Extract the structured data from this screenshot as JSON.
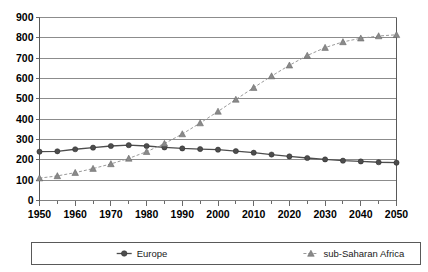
{
  "chart_data": {
    "type": "line",
    "title": "",
    "xlabel": "",
    "ylabel": "",
    "xlim": [
      1950,
      2050
    ],
    "ylim": [
      0,
      900
    ],
    "ytick_step": 100,
    "xtick_step": 10,
    "minor_xtick_step": 5,
    "grid": "horizontal",
    "legend_position": "bottom",
    "yticks": [
      "0",
      "100",
      "200",
      "300",
      "400",
      "500",
      "600",
      "700",
      "800",
      "900"
    ],
    "xticks": [
      "1950",
      "1960",
      "1970",
      "1980",
      "1990",
      "2000",
      "2010",
      "2020",
      "2030",
      "2040",
      "2050"
    ],
    "x": [
      1950,
      1955,
      1960,
      1965,
      1970,
      1975,
      1980,
      1985,
      1990,
      1995,
      2000,
      2005,
      2010,
      2015,
      2020,
      2025,
      2030,
      2035,
      2040,
      2045,
      2050
    ],
    "series": [
      {
        "name": "Europe",
        "marker": "circle",
        "color": "#4d4d4d",
        "linestyle": "solid",
        "values": [
          240,
          242,
          252,
          260,
          268,
          272,
          268,
          261,
          256,
          253,
          250,
          243,
          235,
          226,
          217,
          209,
          202,
          196,
          192,
          188,
          186
        ]
      },
      {
        "name": "sub-Saharan Africa",
        "marker": "triangle",
        "color": "#9a9a9a",
        "linestyle": "dashed",
        "values": [
          110,
          121,
          137,
          157,
          180,
          207,
          240,
          280,
          327,
          381,
          438,
          497,
          555,
          612,
          665,
          713,
          752,
          780,
          798,
          809,
          815
        ]
      }
    ]
  },
  "legend": {
    "items": [
      {
        "label": "Europe"
      },
      {
        "label": "sub-Saharan Africa"
      }
    ]
  },
  "colors": {
    "europe": "#4d4d4d",
    "africa": "#9a9a9a",
    "grid": "#808080",
    "axis": "#595959",
    "background": "#ffffff"
  }
}
